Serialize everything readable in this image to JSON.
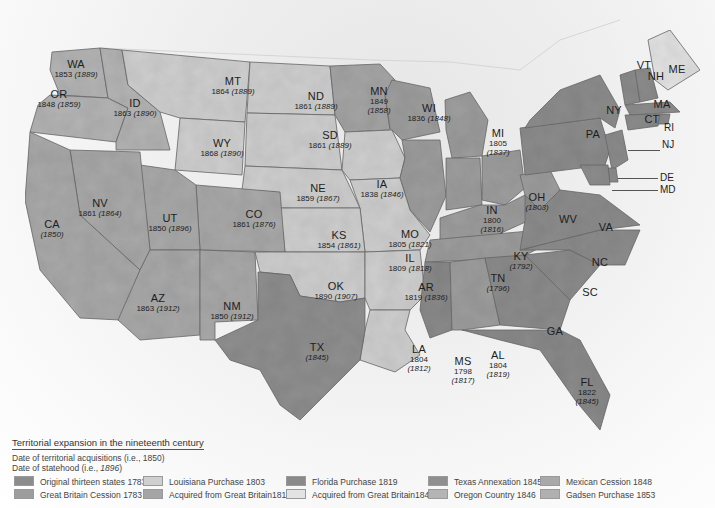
{
  "map": {
    "colors": {
      "original_thirteen": "#8c8c8c",
      "great_britain_1783": "#9d9d9d",
      "louisiana": "#cfcfcf",
      "gb_1818": "#a5a5a5",
      "florida": "#8a8a8a",
      "gb_1842": "#e3e3e3",
      "texas": "#8f8f8f",
      "oregon": "#b4b4b4",
      "mexican": "#a9a9a9",
      "gadsden": "#b0b0b0",
      "water": "#f4f4f4",
      "canada": "#ececec"
    },
    "states": {
      "WA": {
        "abbr": "WA",
        "acq": "1853",
        "stat": "1889"
      },
      "OR": {
        "abbr": "OR",
        "acq": "1848",
        "stat": "1859"
      },
      "ID": {
        "abbr": "ID",
        "acq": "1863",
        "stat": "1890"
      },
      "MT": {
        "abbr": "MT",
        "acq": "1864",
        "stat": "1889"
      },
      "WY": {
        "abbr": "WY",
        "acq": "1868",
        "stat": "1890"
      },
      "ND": {
        "abbr": "ND",
        "acq": "1861",
        "stat": "1889"
      },
      "SD": {
        "abbr": "SD",
        "acq": "1861",
        "stat": "1889"
      },
      "MN": {
        "abbr": "MN",
        "acq": "1849",
        "stat": "1858"
      },
      "WI": {
        "abbr": "WI",
        "acq": "1836",
        "stat": "1848"
      },
      "MI": {
        "abbr": "MI",
        "acq": "1805",
        "stat": "1837"
      },
      "IA": {
        "abbr": "IA",
        "acq": "1838",
        "stat": "1846"
      },
      "NE": {
        "abbr": "NE",
        "acq": "1859",
        "stat": "1867"
      },
      "NV": {
        "abbr": "NV",
        "acq": "1861",
        "stat": "1864"
      },
      "UT": {
        "abbr": "UT",
        "acq": "1850",
        "stat": "1896"
      },
      "CA": {
        "abbr": "CA",
        "acq": "",
        "stat": "1850"
      },
      "CO": {
        "abbr": "CO",
        "acq": "1861",
        "stat": "1876"
      },
      "KS": {
        "abbr": "KS",
        "acq": "1854",
        "stat": "1861"
      },
      "MO": {
        "abbr": "MO",
        "acq": "1805",
        "stat": "1821"
      },
      "IL": {
        "abbr": "IL",
        "acq": "1809",
        "stat": "1818"
      },
      "IN": {
        "abbr": "IN",
        "acq": "1800",
        "stat": "1816"
      },
      "OH": {
        "abbr": "OH",
        "acq": "",
        "stat": "1803"
      },
      "KY": {
        "abbr": "KY",
        "acq": "",
        "stat": "1792"
      },
      "TN": {
        "abbr": "TN",
        "acq": "",
        "stat": "1796"
      },
      "AZ": {
        "abbr": "AZ",
        "acq": "1863",
        "stat": "1912"
      },
      "NM": {
        "abbr": "NM",
        "acq": "1850",
        "stat": "1912"
      },
      "OK": {
        "abbr": "OK",
        "acq": "1890",
        "stat": "1907"
      },
      "AR": {
        "abbr": "AR",
        "acq": "1819",
        "stat": "1836"
      },
      "TX": {
        "abbr": "TX",
        "acq": "",
        "stat": "1845"
      },
      "LA": {
        "abbr": "LA",
        "acq": "1804",
        "stat": "1812"
      },
      "MS": {
        "abbr": "MS",
        "acq": "1798",
        "stat": "1817"
      },
      "AL": {
        "abbr": "AL",
        "acq": "1804",
        "stat": "1819"
      },
      "GA": {
        "abbr": "GA"
      },
      "FL": {
        "abbr": "FL",
        "acq": "1822",
        "stat": "1845"
      },
      "SC": {
        "abbr": "SC"
      },
      "NC": {
        "abbr": "NC"
      },
      "VA": {
        "abbr": "VA"
      },
      "WV": {
        "abbr": "WV"
      },
      "PA": {
        "abbr": "PA"
      },
      "NY": {
        "abbr": "NY"
      },
      "VT": {
        "abbr": "VT"
      },
      "NH": {
        "abbr": "NH"
      },
      "ME": {
        "abbr": "ME"
      },
      "MA": {
        "abbr": "MA"
      },
      "CT": {
        "abbr": "CT"
      },
      "RI": {
        "abbr": "RI"
      },
      "NJ": {
        "abbr": "NJ"
      },
      "DE": {
        "abbr": "DE"
      },
      "MD": {
        "abbr": "MD"
      }
    }
  },
  "legend": {
    "title": "Territorial expansion in the nineteenth century",
    "acq_note": "Date of territorial acquisitions (i.e., 1850)",
    "stat_note_prefix": "Date of statehood (i.e., ",
    "stat_note_year": "1896",
    "stat_note_suffix": ")",
    "items": [
      {
        "label": "Original thirteen states 1783",
        "color": "#8c8c8c"
      },
      {
        "label": "Great Britain Cession  1783",
        "color": "#9d9d9d"
      },
      {
        "label": "Louisiana Purchase 1803",
        "color": "#cfcfcf"
      },
      {
        "label": "Acquired from Great Britain1818",
        "color": "#a5a5a5"
      },
      {
        "label": "Florida Purchase 1819",
        "color": "#8a8a8a"
      },
      {
        "label": "Acquired from Great Britain1842",
        "color": "#e3e3e3"
      },
      {
        "label": "Texas Annexation 1845",
        "color": "#8f8f8f"
      },
      {
        "label": "Oregon Country 1846",
        "color": "#b4b4b4"
      },
      {
        "label": "Mexican Cession 1848",
        "color": "#a9a9a9"
      },
      {
        "label": "Gadsen Purchase 1853",
        "color": "#b0b0b0"
      }
    ]
  }
}
